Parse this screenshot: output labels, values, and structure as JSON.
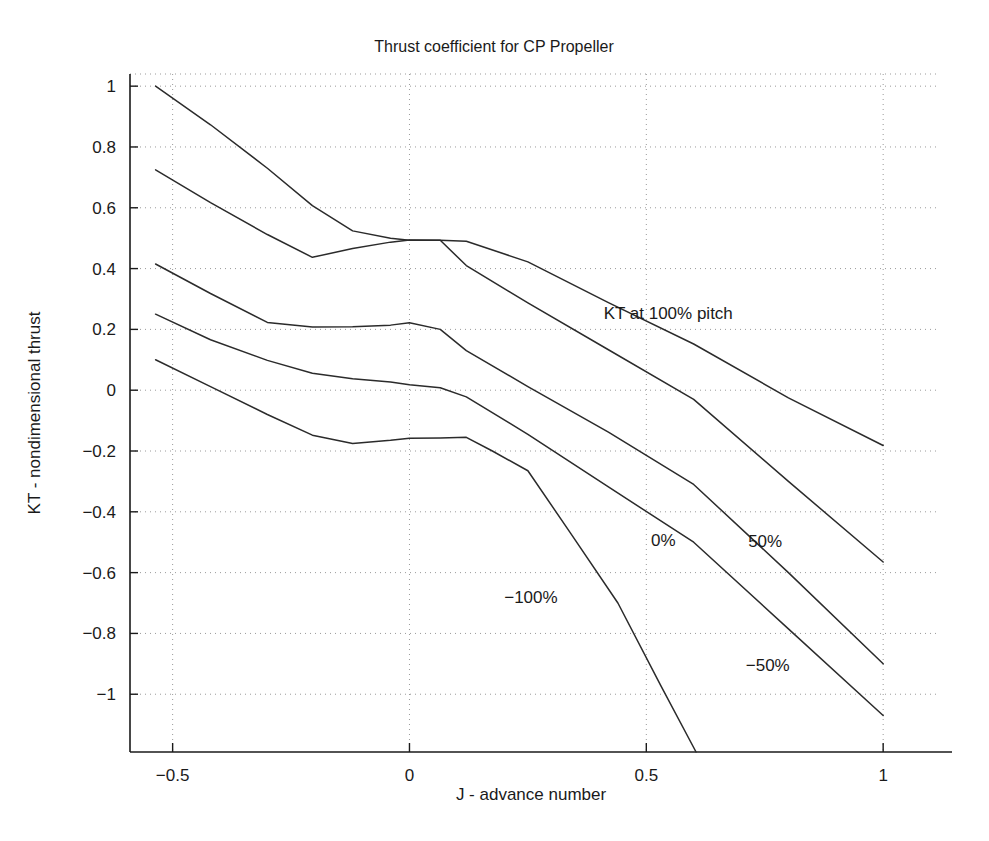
{
  "chart_data": {
    "type": "line",
    "title": "Thrust coefficient for CP Propeller",
    "xlabel": "J - advance number",
    "ylabel": "KT - nondimensional thrust",
    "xlim": [
      -0.59,
      1.12
    ],
    "ylim": [
      -1.19,
      1.04
    ],
    "grid": true,
    "legend": "inline-annotations",
    "xticks": [
      -0.5,
      0,
      0.5,
      1
    ],
    "xtick_labels": [
      "−0.5",
      "0",
      "0.5",
      "1"
    ],
    "yticks": [
      1,
      0.8,
      0.6,
      0.4,
      0.2,
      0,
      -0.2,
      -0.4,
      -0.6,
      -0.8,
      -1
    ],
    "ytick_labels": [
      "1",
      "0.8",
      "0.6",
      "0.4",
      "0.2",
      "0",
      "−0.2",
      "−0.4",
      "−0.6",
      "−0.8",
      "−1"
    ],
    "series": [
      {
        "name": "KT at 100% pitch",
        "label": "KT at 100% pitch",
        "label_x": 0.41,
        "label_y": 0.235,
        "x": [
          -0.536,
          -0.42,
          -0.3,
          -0.205,
          -0.12,
          -0.04,
          0.0,
          0.065,
          0.12,
          0.25,
          0.42,
          0.6,
          0.8,
          1.0
        ],
        "y": [
          1.0,
          0.873,
          0.73,
          0.607,
          0.524,
          0.5,
          0.493,
          0.493,
          0.49,
          0.422,
          0.288,
          0.152,
          -0.025,
          -0.182
        ]
      },
      {
        "name": "KT at 50% pitch",
        "label": "50%",
        "label_x": 0.715,
        "label_y": -0.515,
        "x": [
          -0.536,
          -0.42,
          -0.3,
          -0.205,
          -0.12,
          -0.04,
          0.0,
          0.065,
          0.12,
          0.25,
          0.42,
          0.6,
          0.8,
          1.0
        ],
        "y": [
          0.725,
          0.617,
          0.512,
          0.437,
          0.466,
          0.487,
          0.494,
          0.493,
          0.41,
          0.287,
          0.133,
          -0.03,
          -0.3,
          -0.565
        ]
      },
      {
        "name": "KT at 0% pitch",
        "label": "0%",
        "label_x": 0.51,
        "label_y": -0.512,
        "x": [
          -0.536,
          -0.42,
          -0.3,
          -0.205,
          -0.12,
          -0.04,
          0.0,
          0.065,
          0.12,
          0.25,
          0.42,
          0.6,
          0.8,
          1.0
        ],
        "y": [
          0.415,
          0.318,
          0.223,
          0.208,
          0.209,
          0.214,
          0.222,
          0.2,
          0.13,
          0.012,
          -0.138,
          -0.31,
          -0.6,
          -0.9
        ]
      },
      {
        "name": "KT at -50% pitch",
        "label": "−50%",
        "label_x": 0.71,
        "label_y": -0.925,
        "x": [
          -0.536,
          -0.42,
          -0.3,
          -0.205,
          -0.12,
          -0.04,
          0.0,
          0.065,
          0.12,
          0.25,
          0.42,
          0.6,
          0.8,
          1.0
        ],
        "y": [
          0.25,
          0.166,
          0.098,
          0.056,
          0.038,
          0.027,
          0.018,
          0.008,
          -0.022,
          -0.145,
          -0.318,
          -0.5,
          -0.785,
          -1.07
        ]
      },
      {
        "name": "KT at -100% pitch",
        "label": "−100%",
        "label_x": 0.2,
        "label_y": -0.7,
        "x": [
          -0.536,
          -0.42,
          -0.3,
          -0.205,
          -0.12,
          -0.04,
          0.0,
          0.065,
          0.12,
          0.175,
          0.25,
          0.34,
          0.44,
          0.53,
          0.605
        ],
        "y": [
          0.1,
          0.012,
          -0.08,
          -0.148,
          -0.175,
          -0.165,
          -0.158,
          -0.157,
          -0.155,
          -0.2,
          -0.265,
          -0.47,
          -0.7,
          -0.97,
          -1.19
        ]
      }
    ]
  }
}
